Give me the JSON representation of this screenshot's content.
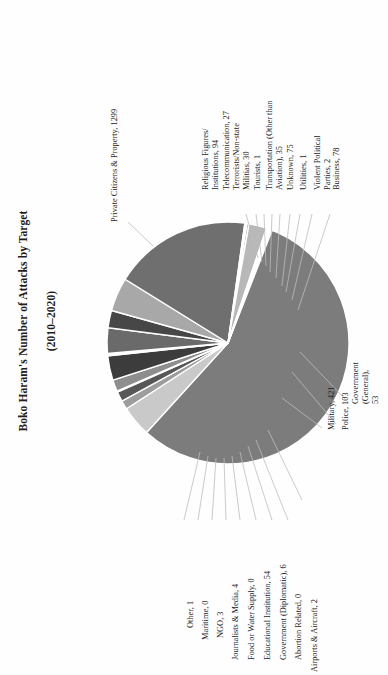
{
  "chart": {
    "title": "Boko Haram's Number of Attacks by Target\n(2010–2020)",
    "title_line1": "Boko Haram's Number of Attacks by Target",
    "title_line2": "(2010–2020)"
  },
  "chart_data": {
    "type": "pie",
    "title": "Boko Haram's Number of Attacks by Target (2010–2020)",
    "xlabel": "",
    "ylabel": "",
    "legend_position": "none",
    "grid": false,
    "labels_show_value": true,
    "total": 2324,
    "categories": [
      "Private Citizens & Property",
      "Religious Figures/Institutions",
      "Telecommunication",
      "Terrorists/Non-state Militias",
      "Tourists",
      "Transportation (Other than Aviation)",
      "Unknown",
      "Utilities",
      "Violent Political Parties",
      "Business",
      "Government (General)",
      "Police",
      "Military",
      "Airports & Aircraft",
      "Abortion Related",
      "Government (Diplomatic)",
      "Educational Institution",
      "Food or Water Supply",
      "Journalists & Media",
      "NGO",
      "Maritime",
      "Other"
    ],
    "values": [
      1299,
      94,
      27,
      30,
      1,
      35,
      75,
      1,
      2,
      78,
      53,
      103,
      421,
      2,
      0,
      6,
      54,
      0,
      4,
      3,
      0,
      1
    ],
    "colors": [
      "#7c7c7c",
      "#c9c9c9",
      "#9d9d9d",
      "#575757",
      "#d8d8d8",
      "#8e8e8e",
      "#3c3c3c",
      "#e0e0e0",
      "#b0b0b0",
      "#6a6a6a",
      "#474747",
      "#a8a8a8",
      "#6f6f6f",
      "#3a3a3a",
      "#d0d0d0",
      "#8a8a8a",
      "#b8b8b8",
      "#cfcfcf",
      "#5c5c5c",
      "#9a9a9a",
      "#dcdcdc",
      "#787878"
    ],
    "slice_labels": [
      "Private Citizens & Property, 1299",
      "Religious Figures/\nInstitutions, 94",
      "Telecommunication, 27",
      "Terrorists/Non-state\nMilitias, 30",
      "Tourists, 1",
      "Transportation (Other than\nAviation), 35",
      "Unknown, 75",
      "Utilities, 1",
      "Violent Political Parties, 2",
      "Business, 78",
      "Government (General), 53",
      "Police, 103",
      "Military, 421",
      "Airports & Aircraft, 2",
      "Abortion Related, 0",
      "Government (Diplomatic), 6",
      "Educational Institution, 54",
      "Food or Water Supply, 0",
      "Journalists & Media, 4",
      "NGO, 3",
      "Maritime, 0",
      "Other, 1"
    ]
  },
  "labels": {
    "private_citizens": "Private Citizens & Property, 1299",
    "religious_figures": "Religious Figures/\nInstitutions, 94",
    "telecommunication": "Telecommunication, 27",
    "terrorists": "Terrorists/Non-state\nMilitias, 30",
    "tourists": "Tourists, 1",
    "transportation": "Transportation (Other than\nAviation), 35",
    "unknown": "Unknown, 75",
    "utilities": "Utilities, 1",
    "violent_political": "Violent Political Parties, 2",
    "business": "Business, 78",
    "government_general": "Government (General), 53",
    "police": "Police, 103",
    "military": "Military, 421",
    "airports": "Airports & Aircraft, 2",
    "abortion": "Abortion Related, 0",
    "government_diplomatic": "Government (Diplomatic), 6",
    "educational": "Educational Institution, 54",
    "food_water": "Food or Water Supply, 0",
    "journalists": "Journalists & Media, 4",
    "ngo": "NGO, 3",
    "maritime": "Maritime, 0",
    "other": "Other, 1"
  }
}
